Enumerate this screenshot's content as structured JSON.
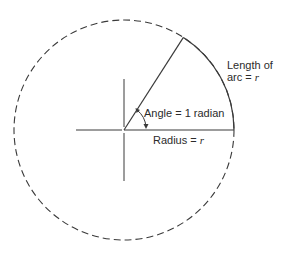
{
  "diagram": {
    "type": "radian-definition",
    "center": {
      "x": 124,
      "y": 130
    },
    "radius": 110,
    "angle_radians": 1,
    "stroke_color": "#3a3a3a",
    "background": "#ffffff"
  },
  "labels": {
    "arc_line1": "Length of",
    "arc_line2_prefix": "arc = ",
    "arc_var": "r",
    "angle": "Angle = 1 radian",
    "radius_prefix": "Radius = ",
    "radius_var": "r"
  }
}
